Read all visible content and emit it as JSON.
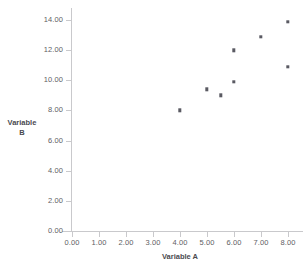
{
  "chart_data": {
    "type": "scatter",
    "title": "",
    "xlabel": "Variable A",
    "ylabel": "Variable B",
    "xlim": [
      0,
      8
    ],
    "ylim": [
      0,
      14
    ],
    "grid": false,
    "legend": null,
    "x_ticks": [
      "0.00",
      "1.00",
      "2.00",
      "3.00",
      "4.00",
      "5.00",
      "6.00",
      "7.00",
      "8.00"
    ],
    "y_ticks": [
      "0.00",
      "2.00",
      "4.00",
      "6.00",
      "8.00",
      "10.00",
      "12.00",
      "14.00"
    ],
    "x_tick_values": [
      0,
      1,
      2,
      3,
      4,
      5,
      6,
      7,
      8
    ],
    "y_tick_values": [
      0,
      2,
      4,
      6,
      8,
      10,
      12,
      14
    ],
    "x": [
      4.0,
      5.0,
      5.5,
      6.0,
      6.0,
      7.0,
      8.0,
      8.0
    ],
    "y": [
      8.0,
      9.4,
      9.0,
      9.9,
      12.0,
      12.9,
      10.9,
      13.9
    ],
    "points": [
      {
        "x": 4.0,
        "y": 8.0
      },
      {
        "x": 5.0,
        "y": 9.4
      },
      {
        "x": 5.5,
        "y": 9.0
      },
      {
        "x": 6.0,
        "y": 9.9
      },
      {
        "x": 6.0,
        "y": 12.0
      },
      {
        "x": 7.0,
        "y": 12.9
      },
      {
        "x": 8.0,
        "y": 10.9
      },
      {
        "x": 8.0,
        "y": 13.9
      }
    ],
    "marker": {
      "shape": "square",
      "color": "#5a5a62",
      "size": 3.4
    },
    "colors": {
      "axis": "#c9c9cc",
      "tick_label": "#5e5e63",
      "axis_title": "#4a4a4f",
      "background": "#ffffff"
    }
  },
  "ylabel_lines": [
    "Variable",
    "B"
  ]
}
